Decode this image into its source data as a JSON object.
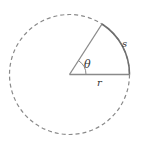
{
  "diagram": {
    "labels": {
      "theta": "θ",
      "s": "s",
      "r": "r"
    },
    "colors": {
      "circle": "#8a8a8a",
      "lines": "#8a8a8a",
      "arc": "#6e6e6e",
      "text": "#333333",
      "background": "#ffffff"
    }
  }
}
